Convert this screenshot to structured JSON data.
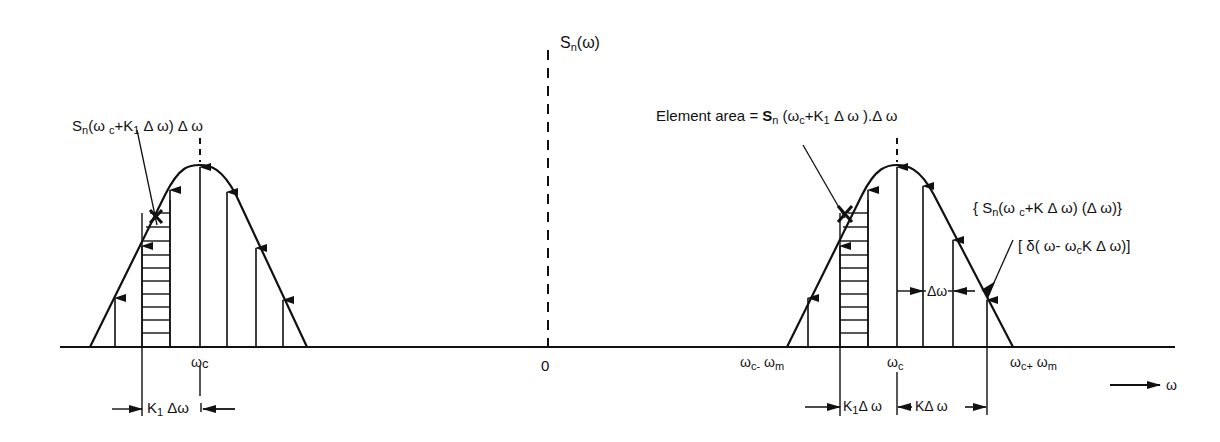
{
  "diagram": {
    "type": "spectral-density-decomposition",
    "y_axis_label": {
      "base": "S",
      "sub": "n",
      "rest": "(ω)"
    },
    "x_axis_label": "ω",
    "origin_label": "0",
    "left_lobe": {
      "top_annotation": {
        "base": "S",
        "sub": "n",
        "open": "(ω ",
        "sub2": "c",
        "rest": "+K",
        "sub3": "1",
        "tail": " Δ ω) Δ ω"
      },
      "center_label": {
        "base": "ω",
        "sub": "c"
      },
      "dimension_label": {
        "base": "K",
        "sub": "1",
        "rest": " Δω"
      }
    },
    "right_lobe": {
      "element_area": {
        "prefix": "Element area = ",
        "base": "S",
        "sub": "n",
        "open": " (ω",
        "sub2": "c",
        "rest": "+K",
        "sub3": "1",
        "tail": " Δ ω ).Δ ω"
      },
      "curly_annotation": {
        "open": "{ S",
        "sub": "n",
        "mid": "(ω ",
        "sub2": "c",
        "tail": "+K Δ ω) (Δ ω)}"
      },
      "delta_annotation": {
        "open": "[ δ( ω- ω",
        "sub": "c",
        "tail": "K Δ ω)]"
      },
      "delta_omega_label": "Δω",
      "lower_label": {
        "base": "ω",
        "sub": "c-",
        "rest": " ω",
        "sub2": "m"
      },
      "center_label": {
        "base": "ω",
        "sub": "c"
      },
      "upper_label": {
        "base": "ω",
        "sub": "c+",
        "rest": " ω",
        "sub2": "m"
      },
      "dim_k1": {
        "base": "K",
        "sub": "1",
        "rest": "Δ ω"
      },
      "dim_k": "KΔ ω"
    },
    "colors": {
      "ink": "#111111",
      "background": "#ffffff"
    }
  }
}
